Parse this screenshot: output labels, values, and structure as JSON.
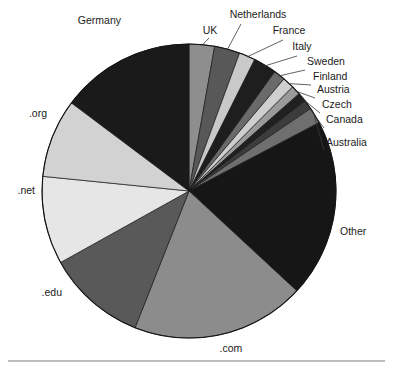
{
  "chart_data": {
    "type": "pie",
    "title": "",
    "subtitle": "",
    "xlabel": "",
    "ylabel": "",
    "legend_position": "none",
    "grid": false,
    "labels_placement": "outside-with-leader-lines",
    "start_angle_deg": 0,
    "direction": "clockwise",
    "categories": [
      "UK",
      "Netherlands",
      "France",
      "Italy",
      "Sweden",
      "Finland",
      "Austria",
      "Czech",
      "Canada",
      "Australia",
      "Other",
      ".com",
      ".edu",
      ".net",
      ".org",
      "Germany"
    ],
    "values": [
      11,
      11,
      7,
      10,
      5,
      5,
      4,
      4,
      4,
      7,
      77,
      75,
      43,
      38,
      34,
      58
    ],
    "value_unit": "degrees",
    "colors": [
      "#8e8e8e",
      "#585858",
      "#c9c9c9",
      "#1e1e1e",
      "#6a6a6a",
      "#cfcfcf",
      "#9a9a9a",
      "#202020",
      "#3c3c3c",
      "#6f6f6f",
      "#161616",
      "#8c8c8c",
      "#595959",
      "#e6e6e6",
      "#d2d2d2",
      "#1a1a1a"
    ],
    "slices": [
      {
        "label": "UK",
        "sweep_deg": 11,
        "color": "#8e8e8e"
      },
      {
        "label": "Netherlands",
        "sweep_deg": 11,
        "color": "#585858"
      },
      {
        "label": "France",
        "sweep_deg": 7,
        "color": "#c9c9c9"
      },
      {
        "label": "Italy",
        "sweep_deg": 10,
        "color": "#1e1e1e"
      },
      {
        "label": "Sweden",
        "sweep_deg": 5,
        "color": "#6a6a6a"
      },
      {
        "label": "Finland",
        "sweep_deg": 5,
        "color": "#cfcfcf"
      },
      {
        "label": "Austria",
        "sweep_deg": 4,
        "color": "#9a9a9a"
      },
      {
        "label": "Czech",
        "sweep_deg": 4,
        "color": "#202020"
      },
      {
        "label": "Canada",
        "sweep_deg": 4,
        "color": "#3c3c3c"
      },
      {
        "label": "Australia",
        "sweep_deg": 7,
        "color": "#6f6f6f"
      },
      {
        "label": "Other",
        "sweep_deg": 77,
        "color": "#161616"
      },
      {
        "label": ".com",
        "sweep_deg": 75,
        "color": "#8c8c8c"
      },
      {
        "label": ".edu",
        "sweep_deg": 43,
        "color": "#595959"
      },
      {
        "label": ".net",
        "sweep_deg": 38,
        "color": "#e6e6e6"
      },
      {
        "label": ".org",
        "sweep_deg": 34,
        "color": "#d2d2d2"
      },
      {
        "label": "Germany",
        "sweep_deg": 58,
        "color": "#1a1a1a"
      }
    ]
  },
  "labels": {
    "germany": "Germany",
    "uk": "UK",
    "netherlands": "Netherlands",
    "france": "France",
    "italy": "Italy",
    "sweden": "Sweden",
    "finland": "Finland",
    "austria": "Austria",
    "czech": "Czech",
    "canada": "Canada",
    "australia": "Australia",
    "other": "Other",
    "com": ".com",
    "edu": ".edu",
    "net": ".net",
    "org": ".org"
  },
  "geometry": {
    "center_x": 189,
    "center_y": 191,
    "radius": 147
  }
}
